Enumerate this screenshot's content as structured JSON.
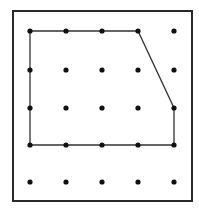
{
  "diagram": {
    "type": "dot-grid-polygon",
    "colors": {
      "background": "#ffffff",
      "frame": "#2a2a2a",
      "dot": "#111111",
      "polygon_stroke": "#333333"
    },
    "frame": {
      "x": 13,
      "y": 11,
      "width": 179,
      "height": 190
    },
    "grid": {
      "columns": 5,
      "rows": 5,
      "x_positions": [
        30,
        66,
        102,
        138,
        174
      ],
      "y_positions": [
        31,
        70,
        108,
        145,
        182
      ],
      "dot_radius": 2.6
    },
    "polygon": {
      "vertices_grid": [
        [
          0,
          0
        ],
        [
          3,
          0
        ],
        [
          4,
          2
        ],
        [
          4,
          3
        ],
        [
          0,
          3
        ]
      ],
      "stroke_width": 1.3,
      "closed": true
    }
  }
}
